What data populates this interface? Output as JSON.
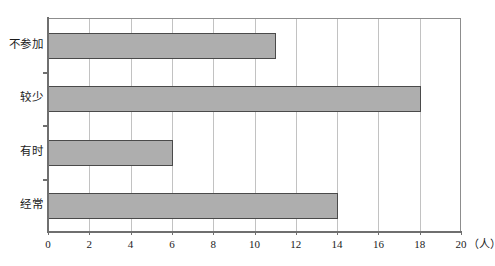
{
  "chart_data": {
    "type": "bar",
    "orientation": "horizontal",
    "title": "",
    "xlabel": "(人)",
    "ylabel": "",
    "categories": [
      "不参加",
      "较少",
      "有时",
      "经常"
    ],
    "values": [
      11,
      18,
      6,
      14
    ],
    "xlim": [
      0,
      20
    ],
    "xticks": [
      0,
      2,
      4,
      6,
      8,
      10,
      12,
      14,
      16,
      18,
      20
    ],
    "xtick_labels": [
      "0",
      "2",
      "4",
      "6",
      "8",
      "10",
      "12",
      "14",
      "16",
      "18",
      "20"
    ],
    "grid": true,
    "grid_axis": "x",
    "legend": null,
    "colors": {
      "bar_fill": "#aeaeae",
      "bar_edge": "#4a4a4a",
      "gridline": "#c2c2c2",
      "frame": "#8d8d8d",
      "axis": "#6f6f6f",
      "text": "#1b1b1b",
      "background": "#ffffff"
    }
  },
  "axis": {
    "unit_label": "（人）"
  }
}
